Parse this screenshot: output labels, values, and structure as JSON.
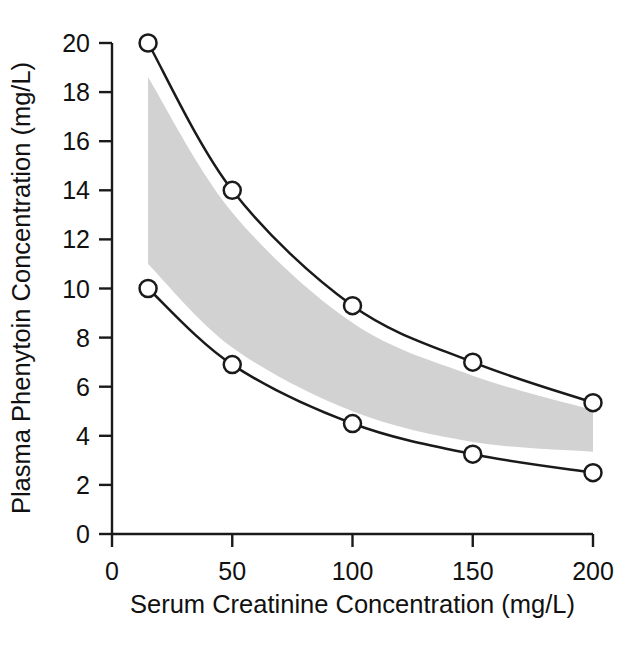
{
  "chart_data": {
    "type": "line",
    "title": "",
    "xlabel": "Serum Creatinine Concentration (mg/L)",
    "ylabel": "Plasma Phenytoin Concentration (mg/L)",
    "xlim": [
      0,
      200
    ],
    "ylim": [
      0,
      20
    ],
    "xticks": [
      0,
      50,
      100,
      150,
      200
    ],
    "yticks": [
      0,
      2,
      4,
      6,
      8,
      10,
      12,
      14,
      16,
      18,
      20
    ],
    "xtick_labels": [
      "0",
      "50",
      "100",
      "150",
      "200"
    ],
    "ytick_labels": [
      "0",
      "2",
      "4",
      "6",
      "8",
      "10",
      "12",
      "14",
      "16",
      "18",
      "20"
    ],
    "grid": false,
    "legend": null,
    "marker": "open-circle",
    "line_color": "#1a1a1a",
    "band_color": "#d2d2d2",
    "background": "#ffffff",
    "x": [
      15,
      50,
      100,
      150,
      200
    ],
    "series": [
      {
        "name": "upper-curve",
        "values": [
          20.0,
          14.0,
          9.3,
          7.0,
          5.35
        ]
      },
      {
        "name": "lower-curve",
        "values": [
          10.0,
          6.9,
          4.5,
          3.25,
          2.5
        ]
      }
    ],
    "shaded_band": {
      "name": "therapeutic-range-band",
      "description": "Shaded region between the two curves",
      "upper_edge": [
        18.6,
        13.1,
        8.6,
        6.45,
        5.05
      ],
      "lower_edge": [
        11.0,
        7.6,
        5.0,
        3.75,
        3.35
      ],
      "x": [
        15,
        50,
        100,
        150,
        200
      ]
    }
  },
  "axes": {
    "x_title": "Serum Creatinine Concentration (mg/L)",
    "y_title": "Plasma Phenytoin Concentration (mg/L)"
  }
}
